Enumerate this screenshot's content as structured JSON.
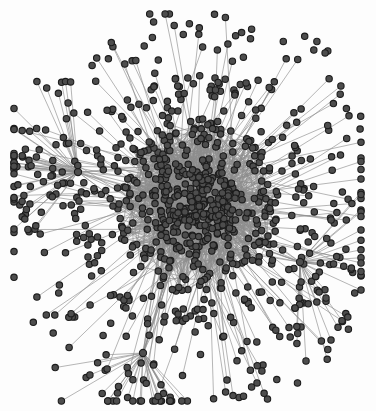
{
  "figure": {
    "kind": "network-graph",
    "title": "",
    "subtitle": "",
    "caption": "",
    "width": 376,
    "height": 411,
    "background_color": "#fdfdfd"
  },
  "style": {
    "node_fill": "#4d4d4d",
    "node_stroke": "#1c1c1c",
    "node_stroke_width": 1.1,
    "node_radius": 3.2,
    "hub_radius": 3.6,
    "edge_color": "#8c8c8c",
    "edge_width": 0.75,
    "edge_opacity": 0.85,
    "core_haze_color": "#6f6f6f"
  },
  "chart_data": {
    "type": "scatter",
    "title": "",
    "xlabel": "",
    "ylabel": "",
    "xlim": [
      0,
      376
    ],
    "ylim": [
      0,
      411
    ],
    "grid": false,
    "legend": "none",
    "layout": "force-directed",
    "node_count": 704,
    "edge_count": 1580,
    "core": {
      "cx": 196,
      "cy": 206,
      "r": 74,
      "density": "saturated"
    },
    "hubs": [
      {
        "id": "hub-left",
        "x": 78,
        "y": 172,
        "spokes": 46
      },
      {
        "id": "hub-bottom",
        "x": 143,
        "y": 353,
        "spokes": 30
      },
      {
        "id": "hub-right",
        "x": 300,
        "y": 262,
        "spokes": 34
      }
    ],
    "bounds": {
      "x_min": 14,
      "x_max": 361,
      "y_min": 14,
      "y_max": 401
    },
    "radial_profile": [
      {
        "band": "core",
        "r_max": 45,
        "nodes": 255
      },
      {
        "band": "inner",
        "r_max": 80,
        "nodes": 210
      },
      {
        "band": "middle",
        "r_max": 120,
        "nodes": 150
      },
      {
        "band": "outer",
        "r_max": 190,
        "nodes": 89
      }
    ]
  }
}
